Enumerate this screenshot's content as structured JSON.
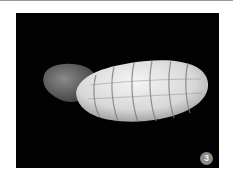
{
  "figure": {
    "panel_label": "3",
    "colors": {
      "background": "#020202",
      "shell_light": "#e6e6e6",
      "shell_band": "#8c8c8c",
      "spire": "#5a5a5a",
      "badge": "#8a8a8a"
    }
  }
}
